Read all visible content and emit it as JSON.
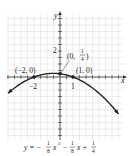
{
  "chart_data": {
    "type": "line",
    "title": "",
    "equation": "y = -1/8 x^2 - 1/8 x + 1/4",
    "xlabel": "x",
    "ylabel": "y",
    "xlim": [
      -4,
      5
    ],
    "ylim": [
      -6,
      5
    ],
    "grid": true,
    "tick_step": 0.5,
    "x_tick_labels": [
      {
        "value": -2,
        "label": "−2"
      },
      {
        "value": 1,
        "label": "1"
      }
    ],
    "y_tick_labels": [
      {
        "value": 2,
        "label": "2"
      }
    ],
    "points": [
      {
        "x": -2,
        "y": 0,
        "label": "(−2, 0)"
      },
      {
        "x": 1,
        "y": 0,
        "label": "(1, 0)"
      },
      {
        "x": 0,
        "y": 0.25,
        "label": "(0, 1/4)"
      }
    ],
    "series": [
      {
        "name": "parabola",
        "x_range": [
          -4,
          4.5
        ],
        "a": -0.125,
        "b": -0.125,
        "c": 0.25
      }
    ]
  },
  "labels": {
    "x_axis": "x",
    "y_axis": "y",
    "tick_neg2": "−2",
    "tick_1": "1",
    "tick_2": "2",
    "pt_neg2": "(−2, 0)",
    "pt_1": "(1, 0)",
    "pt_vertex_prefix": "(0,",
    "pt_vertex_num": "1",
    "pt_vertex_den": "4",
    "pt_vertex_suffix": ")",
    "eq_y": "y = −",
    "eq_f1_num": "1",
    "eq_f1_den": "8",
    "eq_x2": "x",
    "eq_sup": "2",
    "eq_minus": "−",
    "eq_f2_num": "1",
    "eq_f2_den": "8",
    "eq_xplus": "x +",
    "eq_f3_num": "1",
    "eq_f3_den": "4"
  },
  "colors": {
    "grid": "#d9d9d9",
    "axis": "#333333",
    "curve": "#222222"
  }
}
